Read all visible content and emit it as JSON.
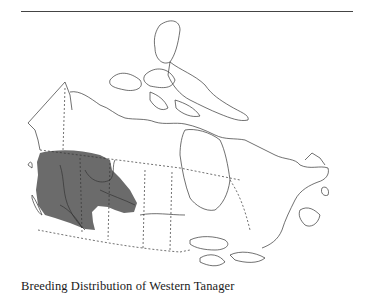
{
  "figure": {
    "caption": "Breeding Distribution of Western Tanager",
    "map_subject": "Canada",
    "range_fill_color": "#6b6b6b",
    "outline_color": "#333333"
  }
}
